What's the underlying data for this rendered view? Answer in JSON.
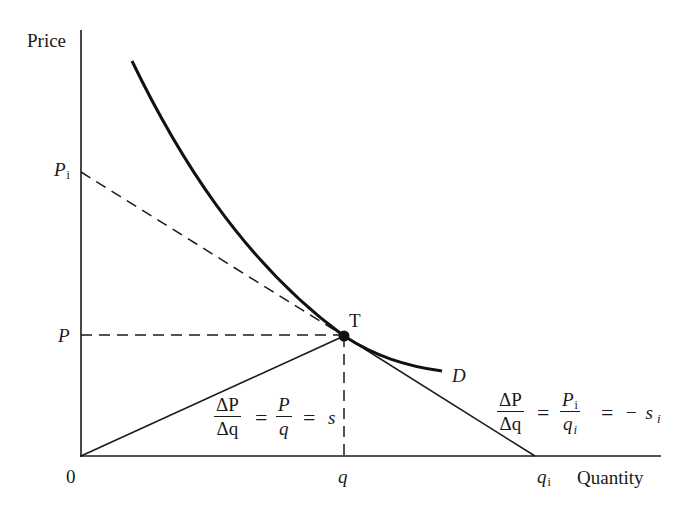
{
  "axes": {
    "y_label": "Price",
    "x_label": "Quantity",
    "origin_label": "0"
  },
  "ticks": {
    "p_i": {
      "base": "P",
      "sub": "i"
    },
    "p": "P",
    "q": "q",
    "q_i": {
      "base": "q",
      "sub": "i"
    }
  },
  "point": {
    "label": "T"
  },
  "curve": {
    "label": "D"
  },
  "formula_left": {
    "frac1_num": "ΔP",
    "frac1_den": "Δq",
    "eq1": "=",
    "frac2_num": "P",
    "frac2_den": "q",
    "eq2": "=",
    "rhs": "s"
  },
  "formula_right": {
    "frac1_num": "ΔP",
    "frac1_den": "Δq",
    "eq1": "=",
    "frac2_num_base": "P",
    "frac2_num_sub": "i",
    "frac2_den_base": "q",
    "frac2_den_sub": "i",
    "eq2": "=",
    "rhs_sign": "−",
    "rhs_base": "s",
    "rhs_sub": "i"
  },
  "colors": {
    "ink": "#1a1a1a",
    "background": "#ffffff"
  }
}
